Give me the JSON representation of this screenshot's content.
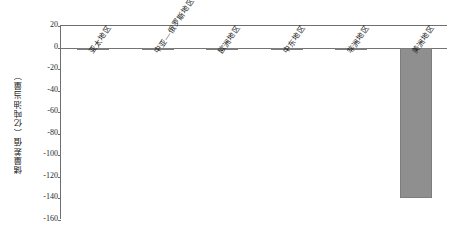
{
  "chart_data": {
    "type": "bar",
    "title": "",
    "xlabel": "",
    "ylabel": "储量差值（亿吨油当量）",
    "categories": [
      "亚太地区",
      "中亚—俄罗斯地区",
      "欧洲地区",
      "中东地区",
      "非洲地区",
      "美洲地区"
    ],
    "values": [
      -1,
      0,
      0,
      0,
      0,
      -140
    ],
    "ylim": [
      -160,
      20
    ],
    "yticks": [
      20,
      0,
      -20,
      -40,
      -60,
      -80,
      -100,
      -120,
      -140,
      -160
    ],
    "ytick_labels": [
      "20",
      "0",
      "-20",
      "-40",
      "-60",
      "-80",
      "-100",
      "-120",
      "-140",
      "-160"
    ],
    "grid": false,
    "legend": null,
    "bar_color": "#8f8f8f",
    "axis_color": "#6e6e6e"
  }
}
